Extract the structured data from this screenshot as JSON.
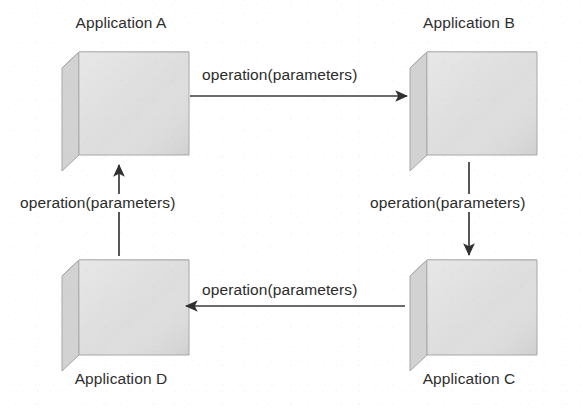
{
  "diagram": {
    "type": "node-edge-cycle",
    "background_color": "#ffffff",
    "nodes": [
      {
        "id": "A",
        "label": "Application A",
        "label_position": "top",
        "x": 62,
        "y": 48,
        "width": 118,
        "height": 112
      },
      {
        "id": "B",
        "label": "Application B",
        "label_position": "top",
        "x": 410,
        "y": 48,
        "width": 118,
        "height": 112
      },
      {
        "id": "C",
        "label": "Application C",
        "label_position": "bottom",
        "x": 410,
        "y": 258,
        "width": 118,
        "height": 102
      },
      {
        "id": "D",
        "label": "Application D",
        "label_position": "bottom",
        "x": 62,
        "y": 258,
        "width": 118,
        "height": 102
      }
    ],
    "edges": [
      {
        "id": "a-to-b",
        "from": "A",
        "to": "B",
        "label": "operation(parameters)",
        "direction": "right"
      },
      {
        "id": "b-to-c",
        "from": "B",
        "to": "C",
        "label": "operation(parameters)",
        "direction": "down"
      },
      {
        "id": "c-to-d",
        "from": "C",
        "to": "D",
        "label": "operation(parameters)",
        "direction": "left"
      },
      {
        "id": "d-to-a",
        "from": "D",
        "to": "A",
        "label": "operation(parameters)",
        "direction": "up"
      }
    ],
    "colors": {
      "cube_front": "#dcdcdc",
      "cube_top": "#e8e8e8",
      "cube_side": "#d0d0d0",
      "cube_edge": "#9a9a9a",
      "arrow": "#333333",
      "text": "#2e2e2e",
      "background": "#ffffff"
    }
  }
}
